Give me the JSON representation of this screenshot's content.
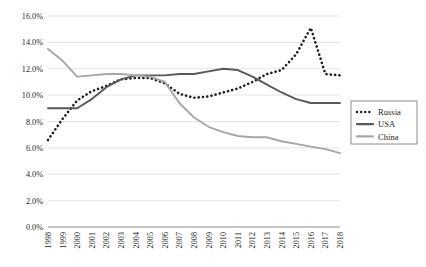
{
  "chart_data": {
    "type": "line",
    "title": "",
    "subtitle": "",
    "xlabel": "",
    "ylabel": "",
    "grid": true,
    "legend_position": "right",
    "ylim": [
      0,
      16
    ],
    "ytick_values": [
      0,
      2,
      4,
      6,
      8,
      10,
      12,
      14,
      16
    ],
    "ytick_labels": [
      "0.0%",
      "2.0%",
      "4.0%",
      "6.0%",
      "8.0%",
      "10.0%",
      "12.0%",
      "14.0%",
      "16.0%"
    ],
    "categories": [
      "1998",
      "1999",
      "2000",
      "2001",
      "2002",
      "2003",
      "2004",
      "2005",
      "2006",
      "2007",
      "2008",
      "2009",
      "2010",
      "2011",
      "2012",
      "2013",
      "2014",
      "2015",
      "2016",
      "2017",
      "2018"
    ],
    "series": [
      {
        "name": "Russia",
        "style": "dotted",
        "color": "#231f20",
        "values": [
          6.6,
          8.2,
          9.6,
          10.3,
          10.7,
          11.2,
          11.3,
          11.3,
          10.9,
          10.1,
          9.8,
          9.9,
          10.2,
          10.5,
          11.0,
          11.6,
          11.9,
          13.1,
          15.1,
          11.6,
          11.5
        ]
      },
      {
        "name": "USA",
        "style": "solid",
        "color": "#595959",
        "values": [
          9.0,
          9.0,
          9.0,
          9.7,
          10.6,
          11.2,
          11.5,
          11.5,
          11.5,
          11.6,
          11.6,
          11.8,
          12.0,
          11.9,
          11.4,
          10.8,
          10.2,
          9.7,
          9.4,
          9.4,
          9.4
        ]
      },
      {
        "name": "China",
        "style": "solid",
        "color": "#a6a6a6",
        "values": [
          13.5,
          12.6,
          11.4,
          11.5,
          11.6,
          11.6,
          11.5,
          11.4,
          11.0,
          9.4,
          8.3,
          7.6,
          7.2,
          6.9,
          6.8,
          6.8,
          6.5,
          6.3,
          6.1,
          5.9,
          5.6
        ]
      }
    ]
  },
  "legend": {
    "items": [
      {
        "label": "Russia",
        "swatch": "dotted-line-swatch"
      },
      {
        "label": "USA",
        "swatch": "solid-dark-line-swatch"
      },
      {
        "label": "China",
        "swatch": "solid-light-line-swatch"
      }
    ]
  },
  "colors": {
    "russia": "#231f20",
    "usa": "#595959",
    "china": "#a6a6a6",
    "gridline": "#d9d9d9",
    "axis": "#808080",
    "legend_border": "#808080",
    "background": "#ffffff"
  }
}
